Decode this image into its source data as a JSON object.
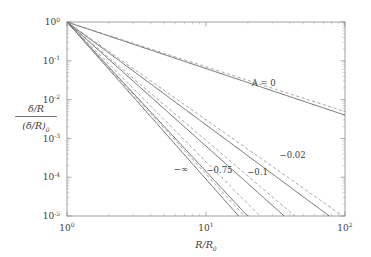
{
  "figure": {
    "background_color": "#ffffff",
    "frame_color": "#8a8a8a",
    "solid_color": "#555555",
    "dashed_color": "#8e8e8e"
  },
  "axes": {
    "x_title_num": "R",
    "x_title_den": "R",
    "x_title_den_sub": "0",
    "x_title_plain": "R/R_0",
    "y_title_num": "δ/R",
    "y_title_den": "(δ/R)",
    "y_title_den_sub": "0",
    "y_title_plain": "(δ/R)/(δ/R)_0",
    "x_scale": "log",
    "y_scale": "log",
    "x_min": 1,
    "x_max": 100,
    "y_min": 1e-05,
    "y_max": 1,
    "x_ticks": [
      {
        "value": 1,
        "mantissa": "10",
        "exponent": "0"
      },
      {
        "value": 10,
        "mantissa": "10",
        "exponent": "1"
      },
      {
        "value": 100,
        "mantissa": "10",
        "exponent": "2"
      }
    ],
    "y_ticks": [
      {
        "value": 1,
        "mantissa": "10",
        "exponent": "0"
      },
      {
        "value": 0.1,
        "mantissa": "10",
        "exponent": "-1"
      },
      {
        "value": 0.01,
        "mantissa": "10",
        "exponent": "-2"
      },
      {
        "value": 0.001,
        "mantissa": "10",
        "exponent": "-3"
      },
      {
        "value": 0.0001,
        "mantissa": "10",
        "exponent": "-4"
      },
      {
        "value": 1e-05,
        "mantissa": "10",
        "exponent": "-5"
      }
    ],
    "grid": false,
    "ticks_direction": "inward",
    "minor_ticks": true
  },
  "chart_data": {
    "type": "line",
    "title": "",
    "subtitle": "",
    "xlabel": "R/R_0",
    "ylabel": "(δ/R)/(δ/R)_0",
    "xscale": "log",
    "yscale": "log",
    "xlim": [
      1,
      100
    ],
    "ylim": [
      1e-05,
      1
    ],
    "grid": false,
    "legend_position": "inline-annotations",
    "annotations": [
      {
        "text": "A = 0",
        "x": 26,
        "y": 0.023,
        "curve": "A0"
      },
      {
        "text": "−0.02",
        "x": 42,
        "y": 0.00032,
        "curve": "Am002"
      },
      {
        "text": "−0.1",
        "x": 23.5,
        "y": 0.000115,
        "curve": "Am01"
      },
      {
        "text": "−0.75",
        "x": 12.5,
        "y": 0.000128,
        "curve": "Am075"
      },
      {
        "text": "−∞",
        "x": 6.6,
        "y": 0.000135,
        "curve": "Aminf"
      }
    ],
    "series": [
      {
        "name": "A = 0",
        "id": "A0",
        "label": "A = 0",
        "style": "solid",
        "slope": -1.2,
        "x": [
          1,
          1.6,
          2.5,
          4,
          6.3,
          10,
          16,
          25,
          40,
          63,
          100
        ],
        "y": [
          1,
          0.5559,
          0.3299,
          0.189,
          0.1104,
          0.0631,
          0.0351,
          0.0201,
          0.0115,
          0.00656,
          0.00398
        ]
      },
      {
        "name": "A = 0 (dashed)",
        "id": "A0d",
        "label": "A = 0",
        "style": "dashed",
        "slope": -1.155,
        "x": [
          1,
          1.6,
          2.5,
          4,
          6.3,
          10,
          16,
          25,
          40,
          63,
          100
        ],
        "y": [
          1,
          0.5677,
          0.3455,
          0.2024,
          0.1208,
          0.07,
          0.0398,
          0.0232,
          0.0136,
          0.00792,
          0.0049
        ]
      },
      {
        "name": "A = −0.02",
        "id": "Am002",
        "label": "−0.02",
        "style": "solid",
        "slope": -2.65,
        "x": [
          1,
          1.6,
          2.5,
          4,
          6.3,
          10,
          16,
          25,
          40,
          63,
          75
        ],
        "y": [
          1,
          0.2561,
          0.0773,
          0.0197,
          0.00575,
          0.00224,
          0.00047,
          0.00012,
          3.05e-05,
          8.2e-06,
          1.1e-05
        ]
      },
      {
        "name": "A = −0.02 (dashed)",
        "id": "Am002d",
        "label": "−0.02",
        "style": "dashed",
        "slope": -2.52,
        "x": [
          1,
          1.6,
          2.5,
          4,
          6.3,
          10,
          16,
          25,
          40,
          63,
          85
        ],
        "y": [
          1,
          0.279,
          0.088,
          0.0244,
          0.00742,
          0.00302,
          0.000665,
          0.000185,
          5.1e-05,
          1.46e-05,
          1.03e-05
        ]
      },
      {
        "name": "A = −0.1",
        "id": "Am01",
        "label": "−0.1",
        "style": "solid",
        "slope": -3.2,
        "x": [
          1,
          1.6,
          2.5,
          4,
          6.3,
          10,
          16,
          25,
          38
        ],
        "y": [
          1,
          0.2177,
          0.0503,
          0.0096,
          0.00216,
          0.00063,
          0.000103,
          2.04e-05,
          1.05e-05
        ]
      },
      {
        "name": "A = −0.1 (dashed)",
        "id": "Am01d",
        "label": "−0.1",
        "style": "dashed",
        "slope": -3.05,
        "x": [
          1,
          1.6,
          2.5,
          4,
          6.3,
          10,
          16,
          25,
          43
        ],
        "y": [
          1,
          0.235,
          0.0575,
          0.0118,
          0.00281,
          0.00089,
          0.000152,
          3.2e-05,
          1.02e-05
        ]
      },
      {
        "name": "A = −0.75",
        "id": "Am075",
        "label": "−0.75",
        "style": "solid",
        "slope": -3.85,
        "x": [
          1,
          1.6,
          2.5,
          4,
          6.3,
          10,
          14,
          20
        ],
        "y": [
          1,
          0.1608,
          0.0275,
          0.00393,
          0.000654,
          0.000141,
          3.97e-05,
          1.03e-05
        ]
      },
      {
        "name": "A = −0.75 (dashed)",
        "id": "Am075d",
        "label": "−0.75",
        "style": "dashed",
        "slope": -3.6,
        "x": [
          1,
          1.6,
          2.5,
          4,
          6.3,
          10,
          16,
          23
        ],
        "y": [
          1,
          0.1807,
          0.0339,
          0.00538,
          0.000984,
          0.000251,
          3.45e-05,
          1.04e-05
        ]
      },
      {
        "name": "A = −∞",
        "id": "Aminf",
        "label": "−∞",
        "style": "solid",
        "slope": -4.05,
        "x": [
          1,
          1.6,
          2.5,
          4,
          6.3,
          10,
          13,
          17.5
        ],
        "y": [
          1,
          0.1455,
          0.023,
          0.00291,
          0.000434,
          8.91e-05,
          3.06e-05,
          1.01e-05
        ]
      },
      {
        "name": "A = −∞ (dashed)",
        "id": "Aminfd",
        "label": "−∞",
        "style": "dashed",
        "slope": -3.92,
        "x": [
          1,
          1.6,
          2.5,
          4,
          6.3,
          10,
          14,
          19
        ],
        "y": [
          1,
          0.154,
          0.0256,
          0.0034,
          0.000527,
          0.00012,
          3.38e-05,
          1.04e-05
        ]
      }
    ]
  }
}
